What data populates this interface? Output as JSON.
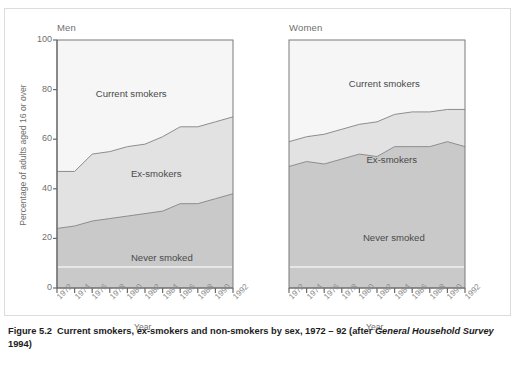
{
  "figure": {
    "caption_number": "Figure 5.2",
    "caption_text": "Current smokers, ex-smokers and non-smokers by sex, 1972 – 92 (after ",
    "caption_source": "General Household Survey",
    "caption_tail": " 1994)"
  },
  "axes": {
    "ylabel": "Percentage of adults aged 16 or over",
    "xlabel_men": "Year",
    "xlabel_women": "Year",
    "yticks": [
      "100",
      "80",
      "60",
      "40",
      "20",
      "0"
    ]
  },
  "panels": {
    "men": {
      "title": "Men"
    },
    "women": {
      "title": "Women"
    }
  },
  "band_labels": {
    "current_men": "Current smokers",
    "ex_men": "Ex-smokers",
    "never_men": "Never smoked",
    "current_women": "Current smokers",
    "ex_women": "Ex-smokers",
    "never_women": "Never smoked"
  },
  "colors": {
    "current_smokers": "#f6f6f6",
    "ex_smokers": "#e2e2e2",
    "never_smoked": "#c9c9c9",
    "line": "#8d8d8d",
    "axis": "#6a6a6a",
    "text": "#6f6f6f"
  },
  "chart_data": {
    "type": "area",
    "title": "Current smokers, ex-smokers and non-smokers by sex, 1972 – 92",
    "xlabel": "Year",
    "ylabel": "Percentage of adults aged 16 or over",
    "ylim": [
      0,
      100
    ],
    "grid": false,
    "legend": "inline band labels",
    "stacked": true,
    "x": [
      1972,
      1974,
      1976,
      1978,
      1980,
      1982,
      1984,
      1986,
      1988,
      1990,
      1992
    ],
    "tick_labels": [
      "1972",
      "1974",
      "1976",
      "1978",
      "1980",
      "1982",
      "1984",
      "1986",
      "1988",
      "1990",
      "1992"
    ],
    "panels": [
      {
        "name": "Men",
        "series": [
          {
            "name": "Never smoked",
            "values": [
              24,
              25,
              27,
              28,
              29,
              30,
              31,
              34,
              34,
              36,
              38
            ]
          },
          {
            "name": "Ex-smokers",
            "values": [
              23,
              22,
              27,
              27,
              28,
              28,
              30,
              31,
              31,
              31,
              31
            ]
          },
          {
            "name": "Current smokers",
            "values": [
              53,
              53,
              46,
              45,
              43,
              42,
              39,
              35,
              35,
              33,
              31
            ]
          }
        ],
        "cumulative_never_smoked": [
          24,
          25,
          27,
          28,
          29,
          30,
          31,
          34,
          34,
          36,
          38
        ],
        "cumulative_never_plus_ex": [
          47,
          47,
          54,
          55,
          57,
          58,
          61,
          65,
          65,
          67,
          69
        ]
      },
      {
        "name": "Women",
        "series": [
          {
            "name": "Never smoked",
            "values": [
              49,
              51,
              50,
              52,
              54,
              53,
              57,
              57,
              57,
              59,
              57
            ]
          },
          {
            "name": "Ex-smokers",
            "values": [
              10,
              10,
              12,
              12,
              12,
              14,
              13,
              14,
              14,
              13,
              15
            ]
          },
          {
            "name": "Current smokers",
            "values": [
              41,
              39,
              38,
              36,
              34,
              33,
              30,
              29,
              29,
              28,
              28
            ]
          }
        ],
        "cumulative_never_smoked": [
          49,
          51,
          50,
          52,
          54,
          53,
          57,
          57,
          57,
          59,
          57
        ],
        "cumulative_never_plus_ex": [
          59,
          61,
          62,
          64,
          66,
          67,
          70,
          71,
          71,
          72,
          72
        ]
      }
    ]
  }
}
